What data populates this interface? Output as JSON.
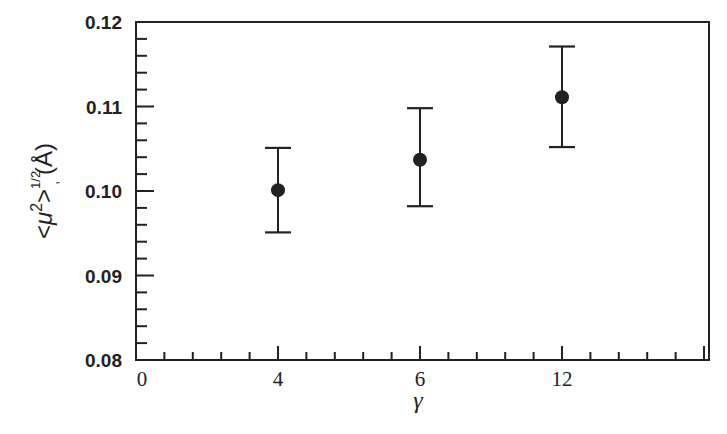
{
  "chart_data": {
    "type": "scatter",
    "title": "",
    "xlabel": "γ",
    "ylabel": "<μ²>^(1/2), (Å)",
    "ylabel_parts": {
      "open": "<",
      "mu": "μ",
      "sup2": "2",
      "close": ">",
      "exp": "1/2",
      "sub": ",",
      "unit": "(Å)"
    },
    "x_categories": [
      "0",
      "4",
      "6",
      "12"
    ],
    "x_category_positions": [
      0,
      1,
      2,
      3
    ],
    "x_range_positions": [
      0,
      4.03
    ],
    "ylim": [
      0.08,
      0.12
    ],
    "y_ticks": [
      0.08,
      0.09,
      0.1,
      0.11,
      0.12
    ],
    "y_tick_labels": [
      "0.08",
      "0.09",
      "0.10",
      "0.11",
      "0.12"
    ],
    "y_minor_step": 0.002,
    "x_minor_per_major": 4,
    "grid": false,
    "legend": null,
    "series": [
      {
        "name": "rms displacement",
        "marker": "filled-circle",
        "color": "#222222",
        "points": [
          {
            "x": "4",
            "y": 0.1001,
            "y_err_low": 0.0951,
            "y_err_high": 0.1051
          },
          {
            "x": "6",
            "y": 0.1037,
            "y_err_low": 0.0982,
            "y_err_high": 0.1098
          },
          {
            "x": "12",
            "y": 0.1111,
            "y_err_low": 0.1052,
            "y_err_high": 0.1171
          }
        ]
      }
    ]
  },
  "style": {
    "ink": "#222222",
    "background": "#ffffff"
  }
}
